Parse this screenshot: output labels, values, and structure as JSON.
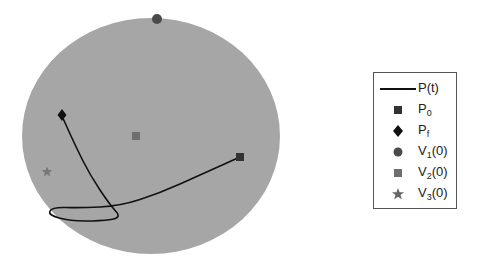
{
  "chart_data": {
    "type": "scatter",
    "title": "",
    "xlabel": "",
    "ylabel": "",
    "grid": false,
    "legend_position": "right",
    "sphere": {
      "cx": 151,
      "cy": 136,
      "rx": 129,
      "ry": 118,
      "color": "#a6a6a6"
    },
    "series": [
      {
        "name": "P(t)",
        "kind": "line",
        "color": "#111111",
        "points": [
          [
            240,
            157
          ],
          [
            200,
            175
          ],
          [
            160,
            193
          ],
          [
            120,
            206
          ],
          [
            80,
            208
          ],
          [
            52,
            207
          ],
          [
            48,
            215
          ],
          [
            70,
            221
          ],
          [
            100,
            221
          ],
          [
            122,
            218
          ],
          [
            110,
            205
          ],
          [
            90,
            175
          ],
          [
            75,
            145
          ],
          [
            62,
            116
          ]
        ]
      },
      {
        "name": "P_0",
        "kind": "marker",
        "marker": "square",
        "color": "#333333",
        "points": [
          [
            240,
            157
          ]
        ]
      },
      {
        "name": "P_f",
        "kind": "marker",
        "marker": "diamond",
        "color": "#111111",
        "points": [
          [
            62,
            115
          ]
        ]
      },
      {
        "name": "V_1(0)",
        "kind": "marker",
        "marker": "circle",
        "color": "#4a4a4a",
        "points": [
          [
            157,
            19
          ]
        ]
      },
      {
        "name": "V_2(0)",
        "kind": "marker",
        "marker": "square",
        "color": "#6e6e6e",
        "points": [
          [
            136,
            136
          ]
        ]
      },
      {
        "name": "V_3(0)",
        "kind": "marker",
        "marker": "star",
        "color": "#777777",
        "points": [
          [
            47,
            172
          ]
        ]
      }
    ]
  },
  "legend": {
    "items": [
      {
        "main": "P(t)",
        "sub": "",
        "tail": ""
      },
      {
        "main": "P",
        "sub": "0",
        "tail": ""
      },
      {
        "main": "P",
        "sub": "f",
        "tail": ""
      },
      {
        "main": "V",
        "sub": "1",
        "tail": "(0)"
      },
      {
        "main": "V",
        "sub": "2",
        "tail": "(0)"
      },
      {
        "main": "V",
        "sub": "3",
        "tail": "(0)"
      }
    ]
  }
}
